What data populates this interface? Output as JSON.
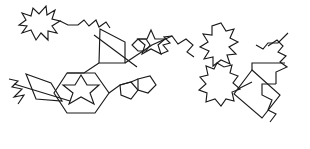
{
  "canvas": {
    "width": 310,
    "height": 149,
    "background_color": "#ffffff",
    "stroke_color": "#1a1a1a",
    "stroke_width": 1.15,
    "description": "Abstract black line drawing of connected polygons, stars and zigzag polylines on a white background"
  },
  "figure": {
    "type": "line-drawing",
    "element_count": 15,
    "elements": [
      {
        "name": "jagged-star-blob-top-left",
        "kind": "closed-polygon",
        "points": "31,30 22,33 27,26 19,25 26,20 22,13 31,16 33,8 39,14 46,6 47,15 55,10 52,19 60,21 52,26 57,33 48,31 48,40 41,33 36,40"
      },
      {
        "name": "upper-left-connector-polyline",
        "kind": "open-polyline",
        "points": "60,21 68,25 78,25 84,20 89,26 96,20 99,27 106,22 110,28"
      },
      {
        "name": "square-upper-middle",
        "kind": "closed-polygon",
        "points": "100,29 125,42 125,63 99,63"
      },
      {
        "name": "crossing-diagonal-upper",
        "kind": "open-polyline",
        "points": "94,35 137,67"
      },
      {
        "name": "star-six-point-upper-middle",
        "kind": "closed-polygon",
        "points": "151,30 155,39 165,39 158,45 161,54 151,49 142,54 145,45 138,39 147,39"
      },
      {
        "name": "hexagon-left-of-star-upper",
        "kind": "closed-polygon",
        "points": "138,39 132,45 138,51 146,51 150,45 146,39"
      },
      {
        "name": "zigzag-right-of-star-upper",
        "kind": "open-polyline",
        "points": "161,54 168,51 163,45 170,43 164,37 172,36"
      },
      {
        "name": "middle-ridge-connector-polyline",
        "kind": "open-polyline",
        "points": "125,63 152,45 172,36 178,44 186,39 193,45 187,52 194,57"
      },
      {
        "name": "star-flower-blob-right",
        "kind": "closed-polygon",
        "points": "221,23 226,31 234,29 230,38 238,42 229,47 236,54 227,55 230,64 221,60 213,66 213,57 204,59 209,51 200,47 208,42 203,34 212,35 212,26"
      },
      {
        "name": "scalloped-flower-blob-bottom-right",
        "kind": "closed-polygon",
        "points": "217,63 224,67 232,65 230,73 238,76 233,83 240,89 232,92 234,101 226,99 221,106 215,99 206,102 207,93 199,90 206,84 200,77 208,75 206,66 214,69"
      },
      {
        "name": "rotated-rectangle-bottom-right",
        "kind": "closed-polygon",
        "points": "252,70 280,95 262,118 234,94"
      },
      {
        "name": "zigzag-far-right-upper",
        "kind": "open-polyline",
        "points": "268,46 277,40 283,46 278,52 286,56 280,62 287,67 276,72 276,84"
      },
      {
        "name": "zigzag-far-right-lower",
        "kind": "open-polyline",
        "points": "288,33 278,43 268,43 263,49 256,45"
      },
      {
        "name": "right-lower-tail-polyline",
        "kind": "open-polyline",
        "points": "276,84 262,84 262,95 272,100 268,110 276,114 270,122"
      },
      {
        "name": "hexagon-bottom-left",
        "kind": "closed-polygon",
        "points": "67,73 95,73 109,93 95,113 67,113 54,93"
      },
      {
        "name": "star-six-point-inside-hexagon",
        "kind": "closed-polygon",
        "points": "81,75 87,85 99,85 90,93 94,104 81,97 69,104 73,93 63,85 75,85"
      },
      {
        "name": "quadrilateral-left",
        "kind": "closed-polygon",
        "points": "26,74 51,83 62,101 36,99"
      },
      {
        "name": "cross-lines-far-left",
        "kind": "open-polyline",
        "points": "9,79 18,81 12,87 22,89 14,97 24,95 18,104"
      },
      {
        "name": "diagonal-left-crossing",
        "kind": "open-polyline",
        "points": "14,84 70,101"
      },
      {
        "name": "pentagon-small-left",
        "kind": "closed-polygon",
        "points": "120,85 131,82 138,90 131,99 121,95"
      },
      {
        "name": "pentagon-small-right",
        "kind": "closed-polygon",
        "points": "138,79 150,76 156,85 148,93 138,90"
      },
      {
        "name": "hexagon-to-pentagon-connector",
        "kind": "open-polyline",
        "points": "109,93 120,85 131,82 138,79"
      },
      {
        "name": "upper-left-descent-polyline",
        "kind": "open-polyline",
        "points": "99,63 84,73 67,73"
      },
      {
        "name": "rectangle-top-connector",
        "kind": "open-polyline",
        "points": "252,70 252,63 285,63"
      },
      {
        "name": "blob-to-rectangle-connector",
        "kind": "open-polyline",
        "points": "238,89 252,82"
      }
    ]
  }
}
